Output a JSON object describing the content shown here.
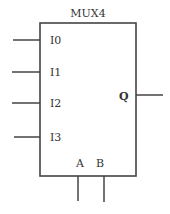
{
  "component": {
    "title": "MUX4",
    "box": {
      "x": 40,
      "y": 23,
      "width": 96,
      "height": 153
    },
    "stroke_color": "#444444"
  },
  "inputs": [
    {
      "label": "I0",
      "y": 40
    },
    {
      "label": "I1",
      "y": 72
    },
    {
      "label": "I2",
      "y": 103
    },
    {
      "label": "I3",
      "y": 137
    }
  ],
  "output": {
    "label": "Q",
    "y": 95
  },
  "selects": [
    {
      "label": "A",
      "x": 78
    },
    {
      "label": "B",
      "x": 104
    }
  ]
}
